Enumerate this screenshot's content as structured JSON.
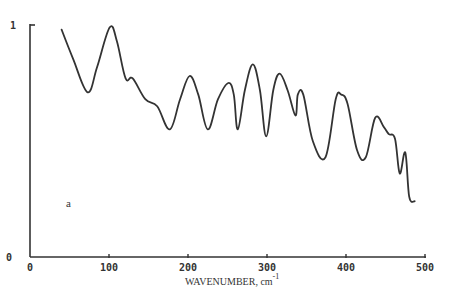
{
  "chart_data": {
    "type": "line",
    "title": "",
    "xlabel": "WAVENUMBER, cm",
    "xlabel_superscript": "-1",
    "ylabel": "",
    "xlim": [
      0,
      500
    ],
    "ylim": [
      0,
      1
    ],
    "x_ticks": [
      "0",
      "100",
      "200",
      "300",
      "400",
      "500"
    ],
    "y_ticks": [
      "0",
      "1"
    ],
    "grid": false,
    "legend": null,
    "annotations": [
      "a"
    ],
    "series": [
      {
        "name": "spectrum a",
        "x": [
          40,
          55,
          73,
          85,
          101,
          110,
          121,
          130,
          146,
          161,
          177,
          190,
          202,
          213,
          225,
          238,
          251,
          258,
          263,
          272,
          282,
          291,
          299,
          308,
          316,
          326,
          336,
          339,
          346,
          358,
          374,
          387,
          394,
          402,
          414,
          425,
          437,
          448,
          454,
          462,
          468,
          475,
          480,
          487
        ],
        "values": [
          0.98,
          0.85,
          0.71,
          0.82,
          0.99,
          0.93,
          0.77,
          0.77,
          0.68,
          0.65,
          0.55,
          0.68,
          0.78,
          0.7,
          0.55,
          0.68,
          0.75,
          0.7,
          0.55,
          0.72,
          0.83,
          0.72,
          0.52,
          0.72,
          0.79,
          0.72,
          0.61,
          0.7,
          0.7,
          0.5,
          0.43,
          0.68,
          0.7,
          0.66,
          0.46,
          0.43,
          0.6,
          0.56,
          0.53,
          0.51,
          0.36,
          0.45,
          0.26,
          0.24
        ]
      }
    ]
  }
}
